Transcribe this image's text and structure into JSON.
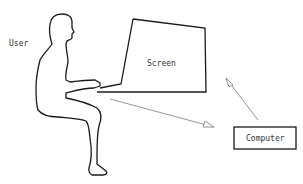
{
  "diagram": {
    "title": "",
    "nodes": [
      {
        "id": "user",
        "label": "User"
      },
      {
        "id": "screen",
        "label": "Screen"
      },
      {
        "id": "computer",
        "label": "Computer"
      }
    ],
    "edges": [
      {
        "from": "user",
        "to": "computer",
        "style": "thin arrow"
      },
      {
        "from": "computer",
        "to": "screen",
        "style": "thin arrow"
      }
    ]
  },
  "colors": {
    "outline": "#1a1a1a",
    "arrow": "#777777",
    "text": "#333333",
    "background": "#ffffff"
  }
}
